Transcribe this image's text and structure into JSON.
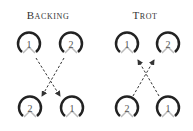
{
  "panels": [
    {
      "title": "Backing",
      "hooves": [
        {
          "label": "1",
          "position": "top-left"
        },
        {
          "label": "2",
          "position": "top-right"
        },
        {
          "label": "2",
          "position": "bottom-left"
        },
        {
          "label": "1",
          "position": "bottom-right"
        }
      ],
      "arrows": "downward-crossing"
    },
    {
      "title": "Trot",
      "hooves": [
        {
          "label": "1",
          "position": "top-left"
        },
        {
          "label": "2",
          "position": "top-right"
        },
        {
          "label": "2",
          "position": "bottom-left"
        },
        {
          "label": "1",
          "position": "bottom-right"
        }
      ],
      "arrows": "upward-crossing"
    }
  ],
  "colors": {
    "hoof": "#222222",
    "frog": "#bbbbbb",
    "arrow": "#333333"
  }
}
